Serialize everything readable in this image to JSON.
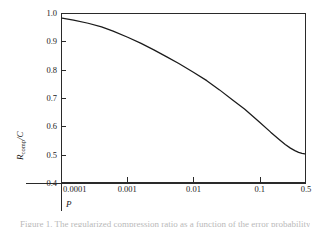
{
  "figure": {
    "caption": "Figure 1. The regularized compression ratio as a function of the error probability."
  },
  "chart_data": {
    "type": "line",
    "title": "",
    "xlabel": "P",
    "ylabel": "R_comp/C",
    "ylabel_base": "R",
    "ylabel_sub": "comp",
    "ylabel_tail": "/C",
    "xscale": "log",
    "yscale": "linear",
    "xlim": [
      0.0001,
      0.5
    ],
    "ylim": [
      0.4,
      1.0
    ],
    "grid": false,
    "legend": null,
    "xticks": [
      0.0001,
      0.001,
      0.01,
      0.1,
      0.5
    ],
    "xtick_labels": [
      "0.0001",
      "0.001",
      "0.01",
      "0.1",
      "0.5"
    ],
    "yticks": [
      0.4,
      0.5,
      0.6,
      0.7,
      0.8,
      0.9,
      1.0
    ],
    "ytick_labels": [
      "0.4",
      "0.5",
      "0.6",
      "0.7",
      "0.8",
      "0.9",
      "1.0"
    ],
    "series": [
      {
        "name": "R_comp/C",
        "color": "#1a1a1a",
        "x": [
          0.0001,
          0.00015,
          0.00025,
          0.0004,
          0.0006,
          0.001,
          0.0016,
          0.0025,
          0.004,
          0.006,
          0.01,
          0.016,
          0.025,
          0.04,
          0.06,
          0.1,
          0.15,
          0.2,
          0.25,
          0.3,
          0.35,
          0.4,
          0.45,
          0.5
        ],
        "y": [
          0.985,
          0.978,
          0.967,
          0.954,
          0.939,
          0.917,
          0.895,
          0.872,
          0.846,
          0.823,
          0.792,
          0.762,
          0.729,
          0.692,
          0.661,
          0.615,
          0.578,
          0.553,
          0.534,
          0.521,
          0.512,
          0.506,
          0.502,
          0.5
        ]
      }
    ]
  }
}
